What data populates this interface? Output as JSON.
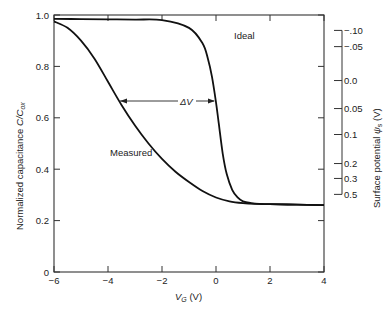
{
  "chart_data": {
    "type": "line",
    "title": "",
    "xlabel": "V_G (V)",
    "ylabel": "Normalized capacitance C/C_ox",
    "y2label": "Surface potential ψ_s (V)",
    "xlim": [
      -6,
      4
    ],
    "ylim": [
      0,
      1.0
    ],
    "grid": false,
    "x_ticks": [
      -6,
      -4,
      -2,
      0,
      2,
      4
    ],
    "x_tick_labels": [
      "−6",
      "−4",
      "−2",
      "0",
      "2",
      "4"
    ],
    "y_ticks": [
      0,
      0.2,
      0.4,
      0.6,
      0.8,
      1.0
    ],
    "y_tick_labels": [
      "0",
      "0.2",
      "0.4",
      "0.6",
      "0.8",
      "1.0"
    ],
    "y2_ticks": [
      {
        "label": "−.10",
        "c": 0.94
      },
      {
        "label": "−.05",
        "c": 0.877
      },
      {
        "label": "0.0",
        "c": 0.745
      },
      {
        "label": "0.05",
        "c": 0.636
      },
      {
        "label": "0.1",
        "c": 0.535
      },
      {
        "label": "0.2",
        "c": 0.422
      },
      {
        "label": "0.3",
        "c": 0.364
      },
      {
        "label": "0.5",
        "c": 0.302
      }
    ],
    "series": [
      {
        "name": "Ideal",
        "x": [
          -6,
          -5,
          -4,
          -3,
          -2,
          -1,
          -0.5,
          -0.3,
          -0.15,
          0,
          0.1,
          0.25,
          0.4,
          0.6,
          0.8,
          1.0,
          1.3,
          1.6,
          2,
          3,
          4
        ],
        "y": [
          0.985,
          0.984,
          0.983,
          0.982,
          0.98,
          0.95,
          0.89,
          0.83,
          0.76,
          0.66,
          0.58,
          0.46,
          0.38,
          0.32,
          0.29,
          0.275,
          0.268,
          0.265,
          0.264,
          0.262,
          0.26
        ]
      },
      {
        "name": "Measured",
        "x": [
          -6,
          -5.5,
          -5,
          -4.5,
          -4,
          -3.5,
          -3,
          -2.5,
          -2,
          -1.5,
          -1,
          -0.5,
          0,
          0.5,
          1,
          1.5,
          2,
          3,
          4
        ],
        "y": [
          0.975,
          0.95,
          0.9,
          0.83,
          0.74,
          0.65,
          0.57,
          0.5,
          0.44,
          0.39,
          0.35,
          0.315,
          0.29,
          0.275,
          0.268,
          0.265,
          0.264,
          0.262,
          0.26
        ]
      }
    ],
    "annotations": [
      {
        "text": "Ideal",
        "x": 0.2,
        "y": 0.9
      },
      {
        "text": "Measured",
        "x": -3.3,
        "y": 0.45
      },
      {
        "text": "ΔV",
        "x": -2.2,
        "y": 0.65,
        "arrow_from": -3.6,
        "arrow_to": -0.1
      }
    ]
  },
  "labels": {
    "xlabel_main": "V",
    "xlabel_sub": "G",
    "xlabel_unit": " (V)",
    "ylabel_main": "Normalized capacitance ",
    "ylabel_ratio": "C/C",
    "ylabel_sub": "ox",
    "y2label_main": "Surface potential ",
    "y2label_sym": "ψ",
    "y2label_sub": "s",
    "y2label_unit": " (V)",
    "ideal": "Ideal",
    "measured": "Measured",
    "delta_v": "ΔV"
  }
}
